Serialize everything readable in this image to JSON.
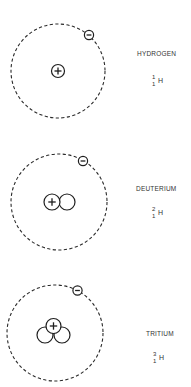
{
  "diagram": {
    "type": "hydrogen-isotopes-bohr-models",
    "isotopes": [
      {
        "name": "HYDROGEN",
        "notation": {
          "mass_number": "1",
          "atomic_number": "1",
          "symbol": "H"
        },
        "protons": 1,
        "neutrons": 0,
        "electrons": 1,
        "proton_sign": "+",
        "electron_sign": "−"
      },
      {
        "name": "DEUTERIUM",
        "notation": {
          "mass_number": "2",
          "atomic_number": "1",
          "symbol": "H"
        },
        "protons": 1,
        "neutrons": 1,
        "electrons": 1,
        "proton_sign": "+",
        "electron_sign": "−"
      },
      {
        "name": "TRITIUM",
        "notation": {
          "mass_number": "3",
          "atomic_number": "1",
          "symbol": "H"
        },
        "protons": 1,
        "neutrons": 2,
        "electrons": 1,
        "proton_sign": "+",
        "electron_sign": "−"
      }
    ],
    "colors": {
      "line": "#1e1e1e",
      "background": "#ffffff"
    }
  }
}
